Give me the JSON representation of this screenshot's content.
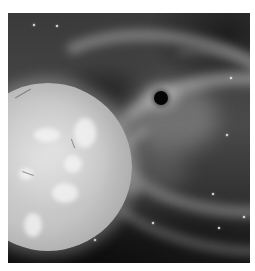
{
  "image": {
    "description": "Grayscale artist illustration of a large bright star beside a small black hole surrounded by swirling accretion gas streams against a starry space background",
    "subjects": [
      "star",
      "black-hole",
      "accretion-gas-streams",
      "background-stars"
    ],
    "palette": {
      "background": "#ffffff",
      "space_dark": "#111111",
      "gas_mid": "#8a8a8a",
      "star_surface": "#c4c4c4",
      "black_hole": "#050505"
    }
  }
}
